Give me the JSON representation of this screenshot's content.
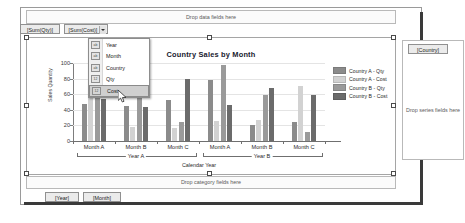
{
  "designer": {
    "data_zone_hint": "Drop data fields here",
    "category_zone_hint": "Drop category fields here",
    "series_zone_hint": "Drop series fields here"
  },
  "fields": {
    "sum_qty": "[Sum(Qty)]",
    "sum_cost": "[Sum(Cost)]",
    "country": "[Country]",
    "year": "[Year]",
    "month": "[Month]"
  },
  "context_menu": {
    "items": [
      {
        "label": "Year",
        "icon": "abc-field-icon",
        "selected": false
      },
      {
        "label": "Month",
        "icon": "abc-field-icon",
        "selected": false
      },
      {
        "label": "Country",
        "icon": "abc-field-icon",
        "selected": false
      },
      {
        "label": "Qty",
        "icon": "numeric-field-icon",
        "selected": false
      },
      {
        "label": "Cost",
        "icon": "numeric-field-icon",
        "selected": true
      }
    ]
  },
  "chart_data": {
    "type": "bar",
    "title": "Country Sales by Month",
    "xlabel": "Calendar Year",
    "ylabel": "Sales Quantity",
    "ylim": [
      0,
      100
    ],
    "yticks": [
      0,
      20,
      40,
      60,
      80,
      100
    ],
    "grid": true,
    "legend_position": "right",
    "categories": [
      "Month A",
      "Month B",
      "Month C",
      "Month A",
      "Month B",
      "Month C"
    ],
    "group_labels": [
      "Year A",
      "Year B"
    ],
    "series": [
      {
        "name": "Country A - Qty",
        "color": "#8b8b8b",
        "values": [
          48,
          45,
          53,
          78,
          20,
          24
        ]
      },
      {
        "name": "Country A - Cost",
        "color": "#d2d2d2",
        "values": [
          62,
          18,
          17,
          26,
          27,
          70
        ]
      },
      {
        "name": "Country B - Qty",
        "color": "#9a9a9a",
        "values": [
          72,
          72,
          25,
          98,
          59,
          11
        ]
      },
      {
        "name": "Country B - Cost",
        "color": "#6b6b6b",
        "values": [
          54,
          44,
          80,
          46,
          68,
          59
        ]
      }
    ]
  }
}
